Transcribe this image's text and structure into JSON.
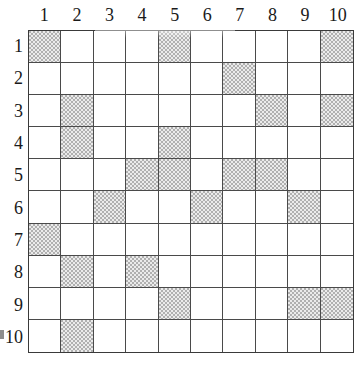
{
  "grid": {
    "title": "",
    "rows": 10,
    "columns": 10,
    "column_headers": [
      "1",
      "2",
      "3",
      "4",
      "5",
      "6",
      "7",
      "8",
      "9",
      "10"
    ],
    "row_headers": [
      "1",
      "2",
      "3",
      "4",
      "5",
      "6",
      "7",
      "8",
      "9",
      "10"
    ],
    "colors": {
      "filled_cell": "#b0b0b0",
      "empty_cell": "#ffffff",
      "grid_line": "#4a4a4a",
      "border": "#3a3a3a",
      "text": "#1a1a1a"
    },
    "legend": {
      "filled_label": "shaded",
      "empty_label": "empty"
    },
    "filled_cells": [
      [
        1,
        5,
        10
      ],
      [
        7
      ],
      [
        2,
        8,
        10
      ],
      [
        2,
        5
      ],
      [
        4,
        5,
        7,
        8
      ],
      [
        3,
        6,
        9
      ],
      [
        1
      ],
      [
        2,
        4
      ],
      [
        5,
        9,
        10
      ],
      [
        2
      ]
    ],
    "cell_matrix": [
      [
        1,
        0,
        0,
        0,
        1,
        0,
        0,
        0,
        0,
        1
      ],
      [
        0,
        0,
        0,
        0,
        0,
        0,
        1,
        0,
        0,
        0
      ],
      [
        0,
        1,
        0,
        0,
        0,
        0,
        0,
        1,
        0,
        1
      ],
      [
        0,
        1,
        0,
        0,
        1,
        0,
        0,
        0,
        0,
        0
      ],
      [
        0,
        0,
        0,
        1,
        1,
        0,
        1,
        1,
        0,
        0
      ],
      [
        0,
        0,
        1,
        0,
        0,
        1,
        0,
        0,
        1,
        0
      ],
      [
        1,
        0,
        0,
        0,
        0,
        0,
        0,
        0,
        0,
        0
      ],
      [
        0,
        1,
        0,
        1,
        0,
        0,
        0,
        0,
        0,
        0
      ],
      [
        0,
        0,
        0,
        0,
        1,
        0,
        0,
        0,
        1,
        1
      ],
      [
        0,
        1,
        0,
        0,
        0,
        0,
        0,
        0,
        0,
        0
      ]
    ],
    "filled_count": 23
  }
}
